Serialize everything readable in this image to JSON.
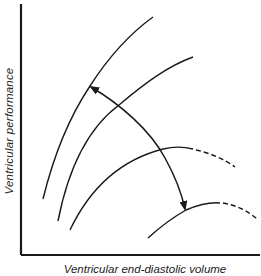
{
  "figure": {
    "ylabel": "Ventricular performance",
    "xlabel": "Ventricular end-diastolic volume",
    "colors": {
      "line": "#1a1a1a",
      "background": "#ffffff"
    }
  },
  "diagram": {
    "type": "line",
    "curves": [
      {
        "id": "curve-1",
        "style": "solid",
        "points": [
          [
            43,
            199
          ],
          [
            60,
            140
          ],
          [
            90,
            86
          ],
          [
            120,
            45
          ],
          [
            153,
            17
          ]
        ]
      },
      {
        "id": "curve-2",
        "style": "solid",
        "points": [
          [
            58,
            221
          ],
          [
            80,
            150
          ],
          [
            119,
            105
          ],
          [
            150,
            75
          ],
          [
            193,
            57
          ]
        ]
      },
      {
        "id": "curve-3",
        "style": "solid-then-dashed",
        "points": [
          [
            70,
            230
          ],
          [
            100,
            180
          ],
          [
            140,
            155
          ],
          [
            163,
            149
          ],
          [
            193,
            149
          ]
        ],
        "dashed_extension": [
          [
            193,
            149
          ],
          [
            215,
            155
          ],
          [
            235,
            167
          ]
        ]
      },
      {
        "id": "curve-4",
        "style": "solid-then-dashed",
        "points": [
          [
            148,
            238
          ],
          [
            170,
            222
          ],
          [
            186,
            210
          ],
          [
            205,
            204
          ],
          [
            220,
            203
          ]
        ],
        "dashed_extension": [
          [
            220,
            203
          ],
          [
            240,
            208
          ],
          [
            257,
            219
          ]
        ]
      }
    ],
    "arrow": {
      "type": "double-headed",
      "from": [
        90,
        86
      ],
      "to": [
        186,
        210
      ],
      "through": [
        [
          119,
          105
        ],
        [
          161,
          150
        ]
      ]
    },
    "axes": {
      "origin": [
        21,
        255
      ],
      "y_top": [
        21,
        4
      ],
      "x_right": [
        260,
        255
      ],
      "ticks": "none",
      "grid": false
    }
  }
}
